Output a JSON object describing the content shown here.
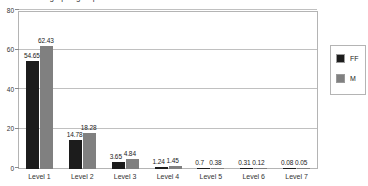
{
  "title": {
    "text": "Percentage per group"
  },
  "legend": {
    "position": "right",
    "entries": [
      {
        "label": "FF",
        "color": "#1c1c1c",
        "name": "legend-item-ff"
      },
      {
        "label": "M",
        "color": "#808080",
        "name": "legend-item-m"
      }
    ]
  },
  "axes": {
    "y_ticks": [
      "0",
      "20",
      "40",
      "60",
      "80"
    ],
    "x_ticks": [
      "Level 1",
      "Level 2",
      "Level 3",
      "Level 4",
      "Level 5",
      "Level 6",
      "Level 7"
    ]
  },
  "chart_data": {
    "type": "bar",
    "title": "Percentage per group",
    "xlabel": "",
    "ylabel": "",
    "ylim": [
      0,
      80
    ],
    "yticks": [
      0,
      20,
      40,
      60,
      80
    ],
    "grid": true,
    "legend_position": "right",
    "categories": [
      "Level 1",
      "Level 2",
      "Level 3",
      "Level 4",
      "Level 5",
      "Level 6",
      "Level 7"
    ],
    "series": [
      {
        "name": "FF",
        "color": "#1c1c1c",
        "values": [
          54.65,
          14.78,
          3.65,
          1.24,
          0.7,
          0.31,
          0.08
        ],
        "labels": [
          "54.65",
          "14.78",
          "3.65",
          "1.24",
          "0.7",
          "0.31",
          "0.08"
        ]
      },
      {
        "name": "M",
        "color": "#808080",
        "values": [
          62.43,
          18.28,
          4.84,
          1.45,
          0.38,
          0.12,
          0.05
        ],
        "labels": [
          "62.43",
          "18.28",
          "4.84",
          "1.45",
          "0.38",
          "0.12",
          "0.05"
        ]
      }
    ]
  }
}
